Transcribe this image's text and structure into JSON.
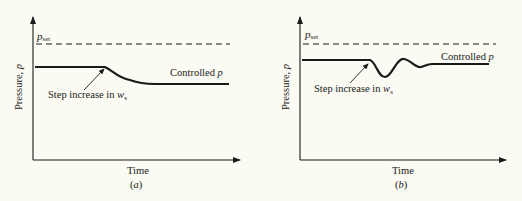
{
  "figure": {
    "panels": [
      {
        "id": "a",
        "caption_open": "(",
        "caption_letter": "a",
        "caption_close": ")",
        "y_axis_label": "Pressure, ",
        "y_axis_symbol": "p",
        "x_axis_label": "Time",
        "setpoint_label": "p",
        "setpoint_subscript": "set",
        "curve_label": "Controlled ",
        "curve_label_symbol": "p",
        "annotation": "Step increase in ",
        "annotation_symbol": "w",
        "annotation_subscript": "s",
        "response_type": "overdamped decrease to lower steady state"
      },
      {
        "id": "b",
        "caption_open": "(",
        "caption_letter": "b",
        "caption_close": ")",
        "y_axis_label": "Pressure, ",
        "y_axis_symbol": "p",
        "x_axis_label": "Time",
        "setpoint_label": "p",
        "setpoint_subscript": "set",
        "curve_label": "Controlled ",
        "curve_label_symbol": "p",
        "annotation": "Step increase in ",
        "annotation_symbol": "w",
        "annotation_subscript": "s",
        "response_type": "underdamped oscillation returning to original level"
      }
    ],
    "colors": {
      "background": "#fbfaf3",
      "ink": "#1a1a1a"
    }
  }
}
